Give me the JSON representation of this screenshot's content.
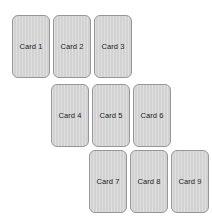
{
  "board": {
    "name": "card-staircase-board",
    "background_color": "#ffffff",
    "width": 212,
    "height": 221,
    "card_width": 38,
    "card_height": 63,
    "card_gap": 3,
    "card_fill_color": "#d2d2d2",
    "card_border_color": "#979797",
    "card_label_color": "#1c1c1c",
    "card_corner_radius": 6
  },
  "rows": [
    {
      "row_label": "row-1",
      "left": 12,
      "top": 15,
      "cards": [
        {
          "label": "Card 1"
        },
        {
          "label": "Card 2"
        },
        {
          "label": "Card 3"
        }
      ]
    },
    {
      "row_label": "row-2",
      "left": 51,
      "top": 84,
      "cards": [
        {
          "label": "Card 4"
        },
        {
          "label": "Card 5"
        },
        {
          "label": "Card 6"
        }
      ]
    },
    {
      "row_label": "row-3",
      "left": 89,
      "top": 150,
      "cards": [
        {
          "label": "Card 7"
        },
        {
          "label": "Card 8"
        },
        {
          "label": "Card 9"
        }
      ]
    }
  ]
}
